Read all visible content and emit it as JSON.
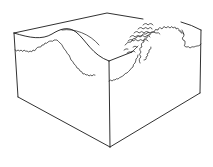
{
  "figure": {
    "description": "Line drawing of a tissue block showing a raised ridge surface with a wavy boundary layer; a scaly patch and a coiled/folded structure on the right side of the top surface",
    "stroke_color": "#1a1a1a",
    "background_color": "#ffffff"
  }
}
